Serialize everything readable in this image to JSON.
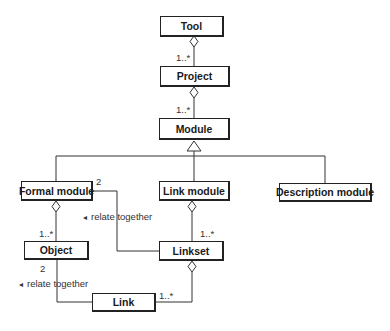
{
  "diagram": {
    "type": "uml-class-diagram",
    "classes": {
      "tool": "Tool",
      "project": "Project",
      "module": "Module",
      "formal_module": "Formal module",
      "link_module": "Link module",
      "description_module": "Description module",
      "object": "Object",
      "linkset": "Linkset",
      "link": "Link"
    },
    "multiplicities": {
      "tool_project": "1..*",
      "project_module": "1..*",
      "formal_module_object": "1..*",
      "formal_module_linkset": "2",
      "link_module_linkset": "1..*",
      "object_link": "2",
      "linkset_link": "1..*"
    },
    "association_labels": {
      "formal_module_linkset": "relate together",
      "object_link": "relate together"
    },
    "direction_arrow": "◂",
    "relationships": [
      {
        "from": "Tool",
        "to": "Project",
        "kind": "aggregation",
        "multiplicity": "1..*"
      },
      {
        "from": "Project",
        "to": "Module",
        "kind": "aggregation",
        "multiplicity": "1..*"
      },
      {
        "from": "Formal module",
        "to": "Module",
        "kind": "generalization"
      },
      {
        "from": "Link module",
        "to": "Module",
        "kind": "generalization"
      },
      {
        "from": "Description module",
        "to": "Module",
        "kind": "generalization"
      },
      {
        "from": "Formal module",
        "to": "Object",
        "kind": "aggregation",
        "multiplicity": "1..*"
      },
      {
        "from": "Link module",
        "to": "Linkset",
        "kind": "aggregation",
        "multiplicity": "1..*"
      },
      {
        "from": "Linkset",
        "to": "Formal module",
        "kind": "association",
        "label": "relate together",
        "multiplicity": "2"
      },
      {
        "from": "Linkset",
        "to": "Link",
        "kind": "aggregation",
        "multiplicity": "1..*"
      },
      {
        "from": "Link",
        "to": "Object",
        "kind": "association",
        "label": "relate together",
        "multiplicity": "2"
      }
    ]
  }
}
